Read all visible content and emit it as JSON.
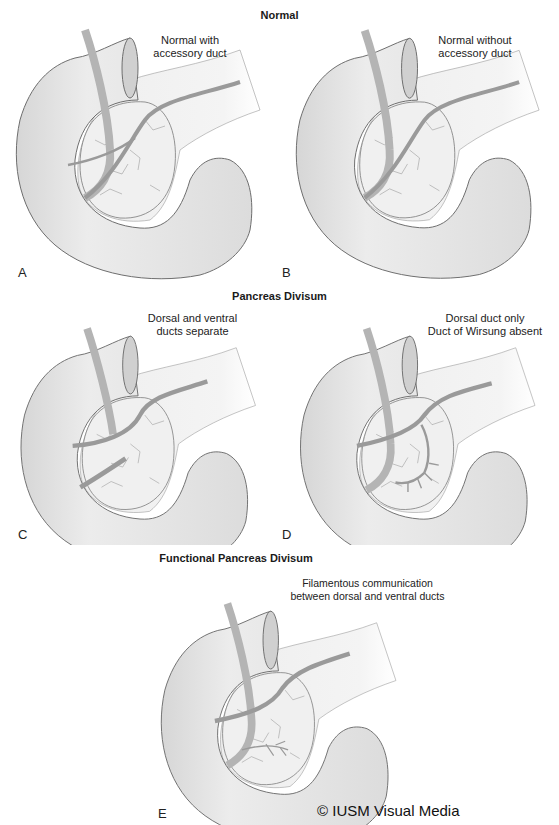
{
  "sections": {
    "normal": "Normal",
    "divisum": "Pancreas Divisum",
    "functional": "Functional Pancreas Divisum"
  },
  "panels": [
    {
      "letter": "A",
      "caption_lines": [
        "Normal with",
        "accessory duct"
      ]
    },
    {
      "letter": "B",
      "caption_lines": [
        "Normal without",
        "accessory duct"
      ]
    },
    {
      "letter": "C",
      "caption_lines": [
        "Dorsal and ventral",
        "ducts separate"
      ]
    },
    {
      "letter": "D",
      "caption_lines": [
        "Dorsal duct only",
        "Duct of Wirsung absent"
      ]
    },
    {
      "letter": "E",
      "caption_lines": [
        "Filamentous communication",
        "between dorsal and ventral ducts"
      ]
    }
  ],
  "copyright": "© IUSM Visual Media",
  "colors": {
    "duodenum_fill": "#e6e6e6",
    "outline": "#6e6e6e",
    "pancreas_fill": "#f1f1f1",
    "duct": "#9a9a9a",
    "bile_duct": "#b4b4b4"
  }
}
